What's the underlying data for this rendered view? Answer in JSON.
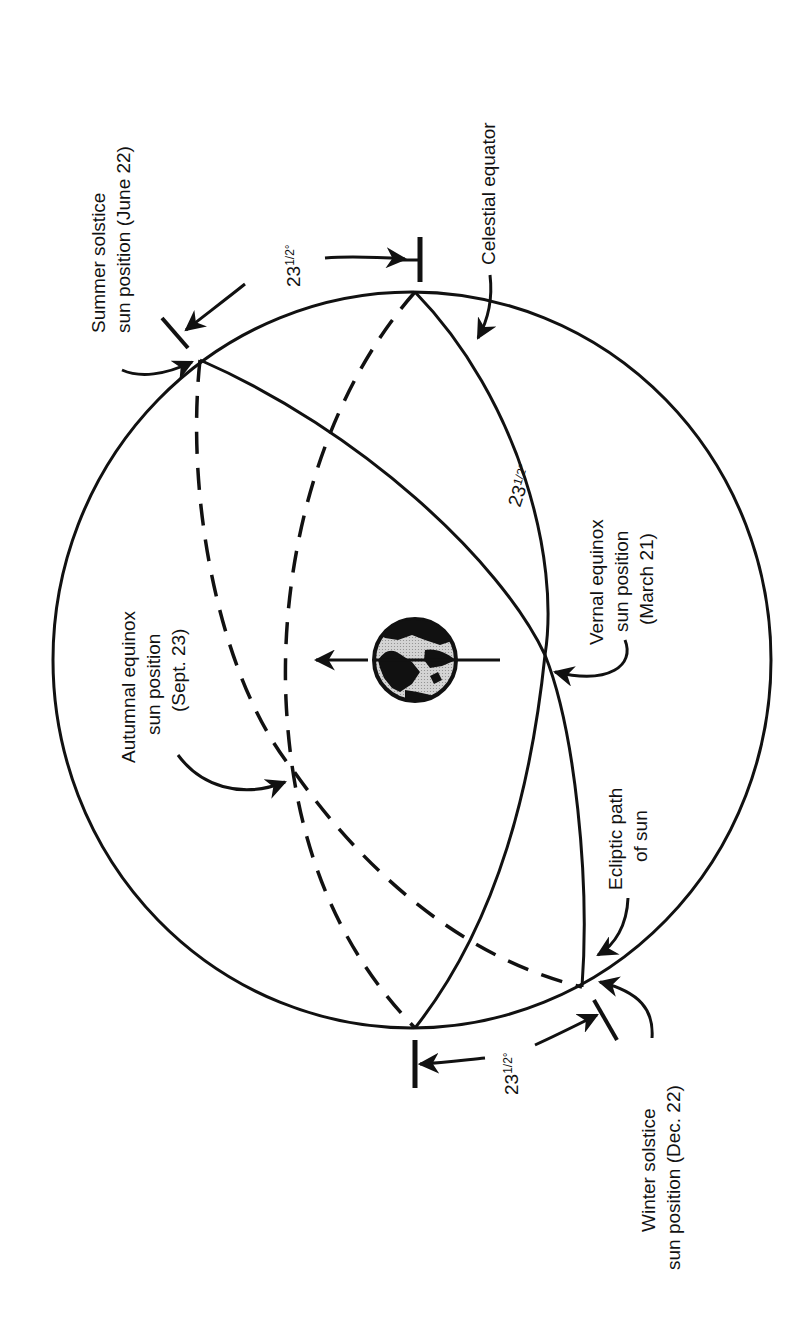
{
  "figure": {
    "orientation": "rotated 90 degrees counter-clockwise (text reads bottom-to-top)"
  },
  "labels": {
    "summer_solstice": {
      "line1": "Summer solstice",
      "line2": "sun position (June 22)"
    },
    "winter_solstice": {
      "line1": "Winter solstice",
      "line2": "sun position (Dec. 22)"
    },
    "autumnal_equinox": {
      "line1": "Autumnal equinox",
      "line2": "sun position",
      "line3": "(Sept. 23)"
    },
    "vernal_equinox": {
      "line1": "Vernal equinox",
      "line2": "sun position",
      "line3": "(March 21)"
    },
    "celestial_equator": {
      "text": "Celestial equator"
    },
    "ecliptic": {
      "line1": "Ecliptic path",
      "line2": "of sun"
    }
  },
  "angles": {
    "tilt_top": {
      "main": "23",
      "frac": "1/2",
      "unit": "°"
    },
    "tilt_center": {
      "main": "23",
      "frac": "1/2",
      "unit": "°"
    },
    "tilt_bottom": {
      "main": "23",
      "frac": "1/2",
      "unit": "°"
    }
  },
  "colors": {
    "ink": "#111111",
    "background": "#ffffff",
    "earth_land": "#111111",
    "earth_ocean": "#c8c8c8"
  }
}
